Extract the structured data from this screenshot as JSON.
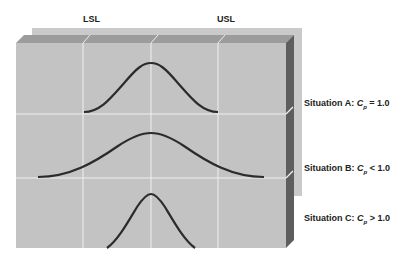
{
  "labels": {
    "lsl": "LSL",
    "usl": "USL"
  },
  "situations": [
    {
      "name": "Situation A",
      "prefix": "Situation A: ",
      "symbol": "C",
      "subscript": "p",
      "relation": " = 1.0"
    },
    {
      "name": "Situation B",
      "prefix": "Situation B: ",
      "symbol": "C",
      "subscript": "p",
      "relation": " < 1.0"
    },
    {
      "name": "Situation C",
      "prefix": "Situation C: ",
      "symbol": "C",
      "subscript": "p",
      "relation": " > 1.0"
    }
  ],
  "colors": {
    "back_panel": "#c9c9c9",
    "top_bevel": "#9a9a9a",
    "front_face": "#c4c4c4",
    "right_side": "#5c5c5c",
    "grid_lines": "#f2f2f2",
    "curve": "#2a2a2a"
  }
}
